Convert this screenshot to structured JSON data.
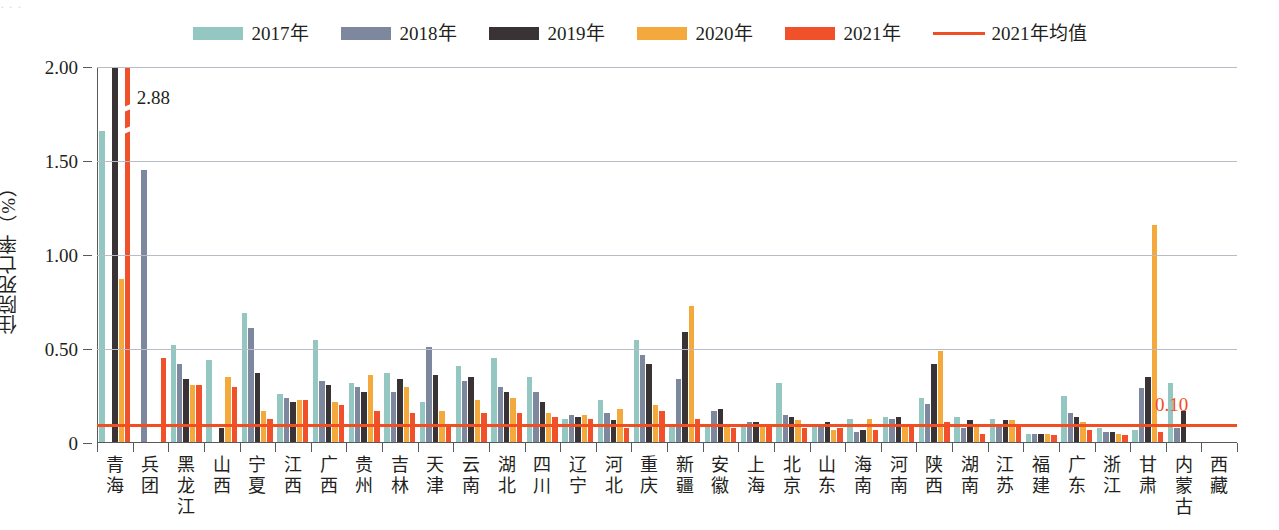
{
  "caption_remnant": "· · ·",
  "legend": {
    "items": [
      {
        "label": "2017年",
        "color": "#94c7c2",
        "type": "swatch",
        "name": "legend-2017"
      },
      {
        "label": "2018年",
        "color": "#7d879e",
        "type": "swatch",
        "name": "legend-2018"
      },
      {
        "label": "2019年",
        "color": "#3a3335",
        "type": "swatch",
        "name": "legend-2019"
      },
      {
        "label": "2020年",
        "color": "#f4a93c",
        "type": "swatch",
        "name": "legend-2020"
      },
      {
        "label": "2021年",
        "color": "#f0502a",
        "type": "swatch",
        "name": "legend-2021"
      },
      {
        "label": "2021年均值",
        "color": "#f04e23",
        "type": "line",
        "name": "legend-mean-2021"
      }
    ]
  },
  "axes": {
    "y_title": "住院死亡率（%）",
    "y_ticks": [
      "0",
      "0.50",
      "1.00",
      "1.50",
      "2.00"
    ],
    "y_tick_values": [
      0,
      0.5,
      1.0,
      1.5,
      2.0
    ],
    "y_min": 0,
    "y_max": 2.0
  },
  "annotations": {
    "peak_label": "2.88",
    "mean_label": "0.10"
  },
  "chart_data": {
    "type": "bar",
    "title": "",
    "xlabel": "",
    "ylabel": "住院死亡率（%）",
    "ylim": [
      0,
      2.0
    ],
    "grid": true,
    "legend_position": "top-center",
    "categories": [
      "青海",
      "兵团",
      "黑龙江",
      "山西",
      "宁夏",
      "江西",
      "广西",
      "贵州",
      "吉林",
      "天津",
      "云南",
      "湖北",
      "四川",
      "辽宁",
      "河北",
      "重庆",
      "新疆",
      "安徽",
      "上海",
      "北京",
      "山东",
      "海南",
      "河南",
      "陕西",
      "湖南",
      "江苏",
      "福建",
      "广东",
      "浙江",
      "甘肃",
      "内蒙古",
      "西藏"
    ],
    "series": [
      {
        "name": "2017年",
        "color": "#94c7c2",
        "values": [
          1.66,
          0,
          0.52,
          0.44,
          0.69,
          0.26,
          0.55,
          0.32,
          0.37,
          0.22,
          0.41,
          0.45,
          0.35,
          0.13,
          0.23,
          0.55,
          0.09,
          0.1,
          0.09,
          0.32,
          0.1,
          0.13,
          0.14,
          0.24,
          0.14,
          0.13,
          0.05,
          0.25,
          0.08,
          0.07,
          0.32,
          0
        ]
      },
      {
        "name": "2018年",
        "color": "#7d879e",
        "values": [
          0,
          1.45,
          0.42,
          0,
          0.61,
          0.24,
          0.33,
          0.3,
          0.27,
          0.51,
          0.33,
          0.3,
          0.27,
          0.15,
          0.16,
          0.47,
          0.34,
          0.17,
          0.11,
          0.15,
          0.1,
          0.06,
          0.13,
          0.21,
          0.08,
          0.09,
          0.05,
          0.16,
          0.06,
          0.29,
          0.08,
          0
        ]
      },
      {
        "name": "2019年",
        "color": "#3a3335",
        "values": [
          2.0,
          0,
          0.34,
          0.08,
          0.37,
          0.22,
          0.31,
          0.27,
          0.34,
          0.36,
          0.35,
          0.27,
          0.22,
          0.14,
          0.12,
          0.42,
          0.59,
          0.18,
          0.11,
          0.14,
          0.11,
          0.07,
          0.14,
          0.42,
          0.12,
          0.12,
          0.05,
          0.14,
          0.06,
          0.35,
          0.17,
          0
        ]
      },
      {
        "name": "2020年",
        "color": "#f4a93c",
        "values": [
          0.87,
          0,
          0.31,
          0.35,
          0.17,
          0.23,
          0.22,
          0.36,
          0.3,
          0.17,
          0.23,
          0.24,
          0.16,
          0.15,
          0.18,
          0.2,
          0.73,
          0.1,
          0.09,
          0.12,
          0.07,
          0.13,
          0.1,
          0.49,
          0.09,
          0.12,
          0.05,
          0.11,
          0.05,
          1.16,
          0,
          0
        ]
      },
      {
        "name": "2021年",
        "color": "#f0502a",
        "values": [
          2.88,
          0.45,
          0.31,
          0.3,
          0.13,
          0.23,
          0.2,
          0.17,
          0.16,
          0.09,
          0.16,
          0.16,
          0.14,
          0.13,
          0.08,
          0.17,
          0.13,
          0.08,
          0.09,
          0.08,
          0.08,
          0.07,
          0.1,
          0.11,
          0.05,
          0.1,
          0.04,
          0.07,
          0.04,
          0.06,
          0,
          0
        ]
      }
    ],
    "mean_line": {
      "name": "2021年均值",
      "value": 0.1,
      "color": "#f04e23",
      "label": "0.10"
    },
    "clipped_bars": [
      {
        "category": "青海",
        "series": "2021年",
        "value": 2.88,
        "label": "2.88"
      }
    ]
  }
}
